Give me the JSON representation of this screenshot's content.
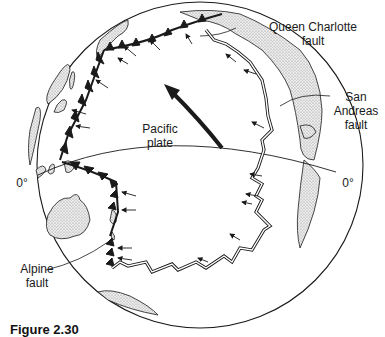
{
  "figure": {
    "caption": "Figure 2.30",
    "labels": {
      "queen_charlotte": [
        "Queen Charlotte",
        "fault"
      ],
      "san_andreas": [
        "San",
        "Andreas",
        "fault"
      ],
      "pacific_plate": [
        "Pacific",
        "plate"
      ],
      "alpine": [
        "Alpine",
        "fault"
      ],
      "equator_left": "0°",
      "equator_right": "0°"
    },
    "colors": {
      "line": "#1a1a1a",
      "land_fill": "#d9d9d9",
      "background": "#ffffff"
    }
  }
}
